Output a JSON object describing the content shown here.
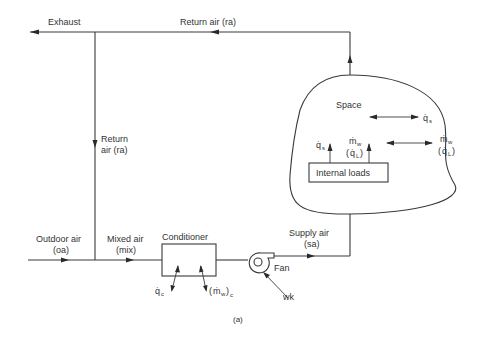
{
  "labels": {
    "exhaust": "Exhaust",
    "return_air_top": "Return air (ra)",
    "return_air_vertical_1": "Return",
    "return_air_vertical_2": "air (ra)",
    "outdoor_air_1": "Outdoor air",
    "outdoor_air_2": "(oa)",
    "mixed_air_1": "Mixed air",
    "mixed_air_2": "(mix)",
    "conditioner": "Conditioner",
    "fan": "Fan",
    "work": "wk",
    "supply_air_1": "Supply air",
    "supply_air_2": "(sa)",
    "space": "Space",
    "internal_loads": "Internal loads",
    "caption": "(a)"
  },
  "symbols": {
    "q_dot": "q̇",
    "m_dot": "ṁ",
    "sub_s": "s",
    "sub_c": "c",
    "sub_w": "w",
    "sub_L": "L",
    "open_paren": "(",
    "close_paren": ")"
  }
}
